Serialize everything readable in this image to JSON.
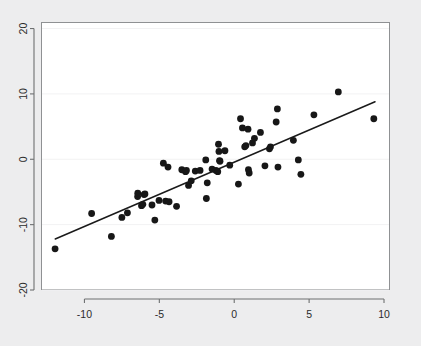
{
  "chart_data": {
    "type": "scatter",
    "title": "",
    "subtitle": "",
    "xlabel": "",
    "ylabel": "",
    "xlim": [
      -12.9,
      10.4
    ],
    "ylim": [
      -20.0,
      21.0
    ],
    "xticks": [
      -10,
      -5,
      0,
      5,
      10
    ],
    "yticks": [
      -20,
      -10,
      0,
      10,
      20
    ],
    "xtick_labels": [
      "-10",
      "-5",
      "0",
      "5",
      "10"
    ],
    "ytick_labels": [
      "-20",
      "-10",
      "0",
      "10",
      "20"
    ],
    "grid": "horizontal-only",
    "grid_color": "#f2f2f3",
    "legend": "none",
    "marker_color": "#171717",
    "marker_shape": "circle",
    "marker_size_px": 3.4,
    "line_color": "#1a1a1a",
    "series": [
      {
        "name": "observations",
        "type": "scatter",
        "points": [
          [
            -11.96,
            -13.7
          ],
          [
            -9.52,
            -8.3
          ],
          [
            -8.2,
            -11.8
          ],
          [
            -7.5,
            -8.9
          ],
          [
            -7.13,
            -8.2
          ],
          [
            -6.45,
            -5.7
          ],
          [
            -6.44,
            -5.2
          ],
          [
            -6.19,
            -7.1
          ],
          [
            -6.1,
            -6.9
          ],
          [
            -6.02,
            -5.4
          ],
          [
            -5.96,
            -5.3
          ],
          [
            -5.49,
            -7.0
          ],
          [
            -5.3,
            -9.3
          ],
          [
            -5.02,
            -6.3
          ],
          [
            -4.73,
            -0.6
          ],
          [
            -4.58,
            -6.4
          ],
          [
            -4.42,
            -1.2
          ],
          [
            -4.35,
            -6.5
          ],
          [
            -3.85,
            -7.2
          ],
          [
            -3.5,
            -1.6
          ],
          [
            -3.25,
            -1.9
          ],
          [
            -3.19,
            -1.7
          ],
          [
            -3.05,
            -4.0
          ],
          [
            -2.87,
            -3.3
          ],
          [
            -2.6,
            -1.8
          ],
          [
            -2.28,
            -1.7
          ],
          [
            -1.9,
            -0.1
          ],
          [
            -1.86,
            -6.0
          ],
          [
            -1.8,
            -3.6
          ],
          [
            -1.48,
            -1.5
          ],
          [
            -1.22,
            -1.7
          ],
          [
            -1.1,
            -1.9
          ],
          [
            -1.05,
            2.3
          ],
          [
            -1.02,
            1.2
          ],
          [
            -0.98,
            -0.2
          ],
          [
            -0.95,
            -0.3
          ],
          [
            -0.62,
            1.3
          ],
          [
            -0.3,
            -0.9
          ],
          [
            0.28,
            -3.8
          ],
          [
            0.42,
            6.2
          ],
          [
            0.55,
            4.8
          ],
          [
            0.7,
            1.9
          ],
          [
            0.78,
            2.1
          ],
          [
            0.92,
            4.6
          ],
          [
            0.95,
            -1.6
          ],
          [
            1.0,
            -2.1
          ],
          [
            1.22,
            2.5
          ],
          [
            1.35,
            3.2
          ],
          [
            1.75,
            4.1
          ],
          [
            2.05,
            -1.0
          ],
          [
            2.35,
            1.6
          ],
          [
            2.42,
            1.9
          ],
          [
            2.8,
            5.7
          ],
          [
            2.88,
            7.7
          ],
          [
            2.92,
            -1.2
          ],
          [
            3.95,
            2.9
          ],
          [
            4.28,
            -0.1
          ],
          [
            4.45,
            -2.3
          ],
          [
            5.32,
            6.8
          ],
          [
            6.95,
            10.3
          ],
          [
            9.32,
            6.2
          ]
        ]
      },
      {
        "name": "fitted-line",
        "type": "line",
        "x_endpoints": [
          -11.95,
          9.4
        ],
        "y_endpoints": [
          -12.2,
          8.8
        ],
        "slope": 0.98,
        "intercept": -0.49
      }
    ],
    "n_points": 61
  },
  "figure": {
    "background_color": "#ededee",
    "plot_background_color": "#ffffff",
    "frame_color": "#8f9193"
  }
}
